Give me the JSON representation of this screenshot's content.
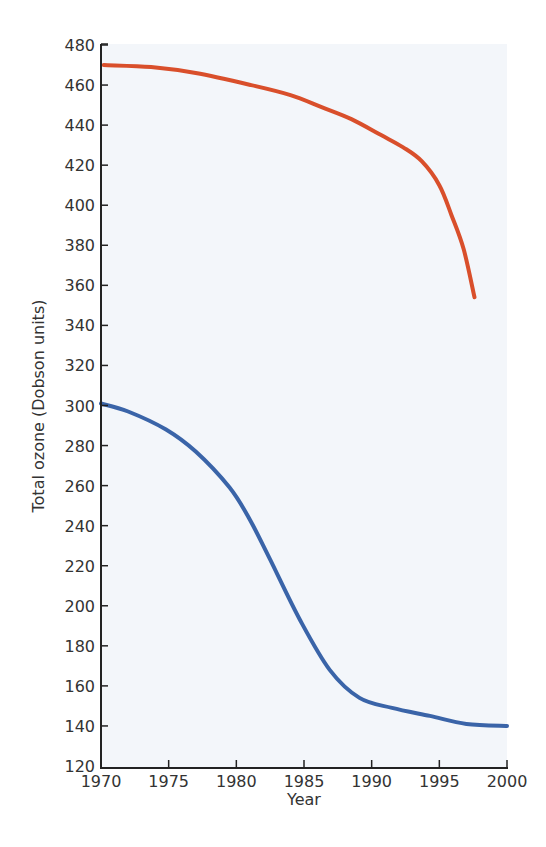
{
  "chart_data": {
    "type": "line",
    "title": "",
    "xlabel": "Year",
    "ylabel": "Total ozone (Dobson units)",
    "xlim": [
      1970,
      2000
    ],
    "ylim": [
      120,
      480
    ],
    "xticks": [
      1970,
      1975,
      1980,
      1985,
      1990,
      1995,
      2000
    ],
    "yticks": [
      120,
      140,
      160,
      180,
      200,
      220,
      240,
      260,
      280,
      300,
      320,
      340,
      360,
      380,
      400,
      420,
      440,
      460,
      480
    ],
    "grid": false,
    "legend": null,
    "series": [
      {
        "name": "upper-curve",
        "color": "#d94f2b",
        "x": [
          1970.2,
          1973.7,
          1977,
          1981.1,
          1984,
          1986.3,
          1988.5,
          1990.7,
          1992.3,
          1993.7,
          1995,
          1995.9,
          1996.8,
          1997.6
        ],
        "y": [
          470,
          469,
          466,
          460,
          455,
          449,
          443,
          435,
          429,
          422,
          410,
          395,
          378,
          354
        ]
      },
      {
        "name": "lower-curve",
        "color": "#3a64a8",
        "x": [
          1970,
          1972,
          1974.8,
          1977,
          1979.5,
          1981,
          1982.5,
          1984.7,
          1986.9,
          1989.1,
          1991.5,
          1994.3,
          1997,
          2000
        ],
        "y": [
          301,
          297,
          288,
          277,
          259,
          243,
          223,
          193,
          168,
          154,
          149,
          145,
          141,
          140
        ]
      }
    ]
  },
  "axes": {
    "x_title": "Year",
    "y_title": "Total ozone (Dobson units)"
  }
}
